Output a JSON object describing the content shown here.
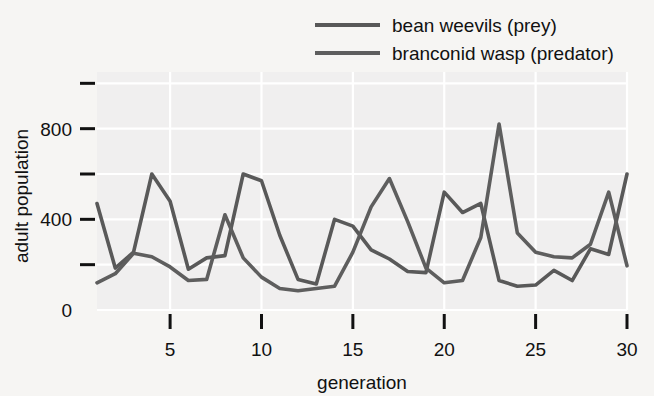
{
  "chart_data": {
    "type": "line",
    "title": "",
    "xlabel": "generation",
    "ylabel": "adult population",
    "xlim": [
      1,
      30
    ],
    "ylim": [
      0,
      1050
    ],
    "grid": true,
    "legend_position": "top-right",
    "x_ticks": [
      5,
      10,
      15,
      20,
      25,
      30
    ],
    "x_tick_labels": [
      "5",
      "10",
      "15",
      "20",
      "25",
      "30"
    ],
    "y_ticks": [
      0,
      200,
      400,
      600,
      800,
      1000
    ],
    "y_tick_labels": [
      "0",
      "",
      "400",
      "",
      "800",
      ""
    ],
    "y_labeled_values": [
      0,
      400,
      800
    ],
    "x": [
      1,
      2,
      3,
      4,
      5,
      6,
      7,
      8,
      9,
      10,
      11,
      12,
      13,
      14,
      15,
      16,
      17,
      18,
      19,
      20,
      21,
      22,
      23,
      24,
      25,
      26,
      27,
      28,
      29,
      30
    ],
    "series": [
      {
        "name": "bean weevils (prey)",
        "color": "#595959",
        "values": [
          470,
          185,
          255,
          600,
          480,
          180,
          230,
          240,
          600,
          570,
          330,
          135,
          115,
          400,
          370,
          265,
          225,
          170,
          165,
          520,
          430,
          470,
          130,
          105,
          110,
          175,
          130,
          270,
          245,
          600
        ]
      },
      {
        "name": "branconid wasp (predator)",
        "color": "#5e5e5e",
        "values": [
          120,
          160,
          250,
          235,
          190,
          130,
          135,
          420,
          230,
          145,
          95,
          85,
          95,
          105,
          255,
          455,
          580,
          390,
          185,
          120,
          130,
          320,
          820,
          340,
          255,
          235,
          230,
          290,
          520,
          195
        ]
      }
    ]
  },
  "legend": {
    "entries": [
      {
        "label": "bean weevils (prey)",
        "swatch_color": "#585858"
      },
      {
        "label": "branconid wasp (predator)",
        "swatch_color": "#5e5e5e"
      }
    ]
  },
  "axes": {
    "x_title": "generation",
    "y_title": "adult population"
  },
  "style": {
    "page_background": "#f6f5f3",
    "plot_background": "#f0efef",
    "gridline_color": "#ffffff",
    "text_color": "#111111",
    "tick_color": "#111111"
  }
}
